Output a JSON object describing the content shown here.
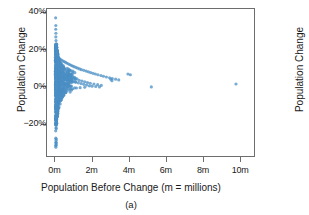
{
  "figure": {
    "caption": "(a)"
  },
  "chart_data": {
    "type": "scatter",
    "title": "",
    "xlabel": "Population Before Change (m = millions)",
    "ylabel": "Population Change",
    "xlim": [
      -0.45,
      10.8
    ],
    "ylim": [
      -0.38,
      0.42
    ],
    "grid": false,
    "legend": null,
    "marker_color": "#4b8fc4",
    "marker_opacity": 0.75,
    "marker_size_px": 2.1,
    "xticks": [
      {
        "value": 0,
        "label": "0m"
      },
      {
        "value": 2,
        "label": "2m"
      },
      {
        "value": 4,
        "label": "4m"
      },
      {
        "value": 6,
        "label": "6m"
      },
      {
        "value": 8,
        "label": "8m"
      },
      {
        "value": 10,
        "label": "10m"
      }
    ],
    "yticks": [
      {
        "value": 0.4,
        "label": "40%"
      },
      {
        "value": 0.2,
        "label": "20%"
      },
      {
        "value": 0.0,
        "label": "0%"
      },
      {
        "value": -0.2,
        "label": "−20%"
      }
    ],
    "points": [
      [
        0.02,
        0.372
      ],
      [
        0.03,
        0.33
      ],
      [
        0.025,
        0.31
      ],
      [
        0.035,
        0.288
      ],
      [
        0.03,
        0.268
      ],
      [
        0.04,
        0.248
      ],
      [
        0.05,
        0.21
      ],
      [
        0.06,
        0.202
      ],
      [
        0.05,
        0.195
      ],
      [
        0.07,
        0.19
      ],
      [
        0.04,
        0.186
      ],
      [
        0.08,
        0.182
      ],
      [
        0.06,
        0.178
      ],
      [
        0.09,
        0.174
      ],
      [
        0.05,
        0.17
      ],
      [
        0.11,
        0.168
      ],
      [
        0.07,
        0.164
      ],
      [
        0.14,
        0.16
      ],
      [
        0.09,
        0.158
      ],
      [
        0.18,
        0.156
      ],
      [
        0.12,
        0.152
      ],
      [
        0.22,
        0.15
      ],
      [
        0.08,
        0.148
      ],
      [
        0.26,
        0.146
      ],
      [
        0.15,
        0.144
      ],
      [
        0.33,
        0.142
      ],
      [
        0.1,
        0.14
      ],
      [
        0.4,
        0.138
      ],
      [
        0.19,
        0.136
      ],
      [
        0.48,
        0.134
      ],
      [
        0.13,
        0.132
      ],
      [
        0.55,
        0.13
      ],
      [
        0.24,
        0.128
      ],
      [
        0.62,
        0.126
      ],
      [
        0.16,
        0.124
      ],
      [
        0.7,
        0.122
      ],
      [
        0.29,
        0.12
      ],
      [
        0.78,
        0.118
      ],
      [
        0.2,
        0.116
      ],
      [
        0.86,
        0.114
      ],
      [
        0.35,
        0.112
      ],
      [
        0.94,
        0.11
      ],
      [
        0.23,
        0.108
      ],
      [
        1.02,
        0.106
      ],
      [
        0.42,
        0.104
      ],
      [
        1.12,
        0.102
      ],
      [
        0.27,
        0.1
      ],
      [
        1.22,
        0.098
      ],
      [
        0.5,
        0.096
      ],
      [
        1.32,
        0.094
      ],
      [
        0.31,
        0.092
      ],
      [
        1.42,
        0.09
      ],
      [
        0.58,
        0.088
      ],
      [
        1.55,
        0.086
      ],
      [
        0.36,
        0.084
      ],
      [
        1.68,
        0.082
      ],
      [
        0.66,
        0.08
      ],
      [
        1.8,
        0.078
      ],
      [
        0.41,
        0.076
      ],
      [
        1.92,
        0.074
      ],
      [
        0.75,
        0.072
      ],
      [
        2.05,
        0.07
      ],
      [
        0.46,
        0.068
      ],
      [
        2.18,
        0.066
      ],
      [
        0.84,
        0.064
      ],
      [
        2.32,
        0.062
      ],
      [
        0.52,
        0.06
      ],
      [
        2.48,
        0.058
      ],
      [
        0.93,
        0.056
      ],
      [
        2.62,
        0.054
      ],
      [
        0.6,
        0.052
      ],
      [
        2.78,
        0.05
      ],
      [
        1.05,
        0.048
      ],
      [
        2.95,
        0.046
      ],
      [
        0.68,
        0.044
      ],
      [
        3.1,
        0.042
      ],
      [
        1.18,
        0.04
      ],
      [
        3.28,
        0.038
      ],
      [
        0.77,
        0.036
      ],
      [
        3.45,
        0.034
      ],
      [
        1.3,
        0.032
      ],
      [
        0.88,
        0.03
      ],
      [
        1.45,
        0.028
      ],
      [
        0.98,
        0.026
      ],
      [
        1.6,
        0.024
      ],
      [
        1.1,
        0.022
      ],
      [
        1.75,
        0.02
      ],
      [
        1.25,
        0.018
      ],
      [
        1.9,
        0.016
      ],
      [
        1.4,
        0.014
      ],
      [
        2.1,
        0.012
      ],
      [
        1.55,
        0.01
      ],
      [
        2.3,
        0.008
      ],
      [
        1.7,
        0.006
      ],
      [
        2.5,
        0.004
      ],
      [
        1.85,
        0.002
      ],
      [
        2.0,
        0.0
      ],
      [
        2.2,
        -0.002
      ],
      [
        2.4,
        -0.004
      ],
      [
        1.6,
        -0.006
      ],
      [
        1.35,
        -0.008
      ],
      [
        1.15,
        -0.01
      ],
      [
        0.95,
        -0.014
      ],
      [
        0.8,
        -0.018
      ],
      [
        0.68,
        -0.022
      ],
      [
        0.58,
        -0.028
      ],
      [
        0.5,
        -0.034
      ],
      [
        0.43,
        -0.04
      ],
      [
        0.37,
        -0.048
      ],
      [
        0.32,
        -0.056
      ],
      [
        0.28,
        -0.064
      ],
      [
        0.24,
        -0.072
      ],
      [
        0.21,
        -0.08
      ],
      [
        0.18,
        -0.088
      ],
      [
        0.16,
        -0.096
      ],
      [
        0.14,
        -0.104
      ],
      [
        0.12,
        -0.112
      ],
      [
        0.1,
        -0.12
      ],
      [
        0.09,
        -0.128
      ],
      [
        0.08,
        -0.136
      ],
      [
        0.07,
        -0.144
      ],
      [
        0.06,
        -0.15
      ],
      [
        0.05,
        -0.158
      ],
      [
        0.045,
        -0.168
      ],
      [
        0.04,
        -0.176
      ],
      [
        0.035,
        -0.125
      ],
      [
        0.03,
        -0.118
      ],
      [
        0.045,
        -0.11
      ],
      [
        3.02,
        0.038
      ],
      [
        3.08,
        0.03
      ],
      [
        3.95,
        0.066
      ],
      [
        4.08,
        0.062
      ],
      [
        5.22,
        -0.004
      ],
      [
        9.82,
        0.012
      ],
      [
        0.03,
        -0.332
      ]
    ]
  },
  "panel_b": {
    "ylabel": "Population Change",
    "visible_ticks": [
      "4",
      "2",
      "−2"
    ]
  }
}
